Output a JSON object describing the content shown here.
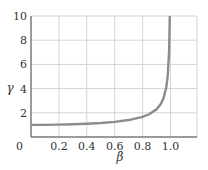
{
  "chart_data": {
    "type": "line",
    "title": "",
    "xlabel": "β",
    "ylabel": "γ",
    "xlim": [
      0,
      1.19
    ],
    "ylim": [
      0,
      10
    ],
    "grid": true,
    "legend": null,
    "xticks": [
      "0",
      "0.2",
      "0.4",
      "0.6",
      "0.8",
      "1.0"
    ],
    "yticks": [
      "2",
      "4",
      "6",
      "8",
      "10"
    ],
    "y_zero_label": "0",
    "series": [
      {
        "name": "γ = 1/√(1−β²)",
        "x": [
          0,
          0.1,
          0.2,
          0.3,
          0.4,
          0.5,
          0.6,
          0.7,
          0.8,
          0.85,
          0.9,
          0.93,
          0.95,
          0.97,
          0.98,
          0.99,
          0.995
        ],
        "y": [
          1.0,
          1.005,
          1.021,
          1.048,
          1.091,
          1.155,
          1.25,
          1.4,
          1.667,
          1.898,
          2.294,
          2.721,
          3.203,
          4.113,
          5.025,
          7.089,
          10.0
        ]
      }
    ],
    "colors": {
      "curve": "#8c8c8c",
      "grid": "#d4d4d4",
      "axis": "#7a7a7a",
      "text": "#333333"
    }
  }
}
